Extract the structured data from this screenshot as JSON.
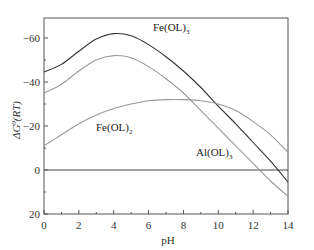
{
  "chart_data": {
    "type": "line",
    "title": "",
    "xlabel": "pH",
    "ylabel": "ΔG°(RT)",
    "xlim": [
      0,
      14
    ],
    "ylim": [
      20,
      -70
    ],
    "y_inverted": true,
    "x_ticks": [
      0,
      2,
      4,
      6,
      8,
      10,
      12,
      14
    ],
    "y_ticks": [
      -60,
      -40,
      -20,
      0,
      20
    ],
    "grid": false,
    "reference_line": {
      "y": 0
    },
    "series": [
      {
        "name": "Fe(OL)3",
        "color": "#333333",
        "x": [
          0,
          1,
          2,
          3,
          4,
          5,
          6,
          7,
          8,
          9,
          10,
          11,
          12,
          13,
          14
        ],
        "values": [
          -44.5,
          -48,
          -54,
          -59.5,
          -62,
          -61,
          -57,
          -51.5,
          -45,
          -37.5,
          -29,
          -21,
          -12.5,
          -4,
          5.5
        ]
      },
      {
        "name": "Al(OL)3",
        "color": "#999999",
        "x": [
          0,
          1,
          2,
          3,
          4,
          5,
          6,
          7,
          8,
          9,
          10,
          11,
          12,
          13,
          14
        ],
        "values": [
          -35,
          -39,
          -45,
          -50,
          -52,
          -51,
          -47,
          -41.5,
          -35,
          -27,
          -19,
          -11,
          -3,
          5,
          12
        ]
      },
      {
        "name": "Fe(OL)2",
        "color": "#999999",
        "x": [
          0,
          1,
          2,
          3,
          4,
          5,
          6,
          7,
          8,
          9,
          10,
          11,
          12,
          13,
          14
        ],
        "values": [
          -11,
          -16,
          -21,
          -25,
          -28,
          -30,
          -31.5,
          -32,
          -32,
          -31.5,
          -30,
          -27,
          -22,
          -16,
          -8
        ]
      }
    ],
    "annotations": [
      {
        "text": "Fe(OL)3",
        "x": 6.3,
        "y": -64
      },
      {
        "text": "Fe(OL)2",
        "x": 2.8,
        "y": -16
      },
      {
        "text": "Al(OL)3",
        "x": 8.8,
        "y": -8
      }
    ]
  },
  "labels": {
    "x_axis": "pH",
    "y_axis_main": "ΔG",
    "y_axis_sup": "0",
    "y_axis_rest": "(RT)",
    "fe3_base": "Fe(OL)",
    "fe3_sub": "3",
    "fe2_base": "Fe(OL)",
    "fe2_sub": "2",
    "al3_base": "Al(OL)",
    "al3_sub": "3"
  },
  "ticks": {
    "x": [
      "0",
      "2",
      "4",
      "6",
      "8",
      "10",
      "12",
      "14"
    ],
    "y": [
      "-60",
      "-40",
      "-20",
      "0",
      "20"
    ]
  }
}
